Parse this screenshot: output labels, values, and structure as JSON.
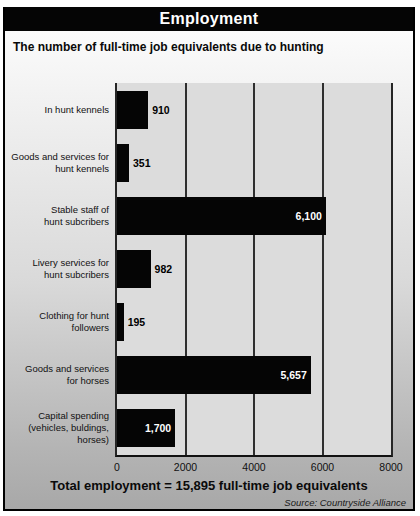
{
  "header": {
    "title": "Employment"
  },
  "subtitle": "The number of full-time job equivalents due to hunting",
  "chart_data": {
    "type": "bar",
    "orientation": "horizontal",
    "title": "Employment",
    "subtitle": "The number of full-time job equivalents due to hunting",
    "categories": [
      "In hunt kennels",
      "Goods and services for hunt kennels",
      "Stable staff of hunt subcribers",
      "Livery services for hunt subcribers",
      "Clothing for hunt followers",
      "Goods and services for horses",
      "Capital spending (vehicles, buldings, horses)"
    ],
    "label_lines": [
      [
        "In hunt kennels"
      ],
      [
        "Goods and services for",
        "hunt kennels"
      ],
      [
        "Stable staff of",
        "hunt subcribers"
      ],
      [
        "Livery services for",
        "hunt subcribers"
      ],
      [
        "Clothing for hunt",
        "followers"
      ],
      [
        "Goods and services",
        "for horses"
      ],
      [
        "Capital spending",
        "(vehicles, buldings,",
        "horses)"
      ]
    ],
    "values": [
      910,
      351,
      6100,
      982,
      195,
      5657,
      1700
    ],
    "value_labels": [
      "910",
      "351",
      "6,100",
      "982",
      "195",
      "5,657",
      "1,700"
    ],
    "xlim": [
      0,
      8000
    ],
    "xticks": [
      0,
      2000,
      4000,
      6000,
      8000
    ],
    "xtick_labels": [
      "0",
      "2000",
      "4000",
      "6000",
      "8000"
    ],
    "grid": true,
    "legend_position": "none",
    "bar_color": "#050505",
    "plot_background": "#dcdcdc"
  },
  "footer": {
    "total": "Total employment = 15,895 full-time job equivalents",
    "source": "Source: Countryside Alliance"
  }
}
